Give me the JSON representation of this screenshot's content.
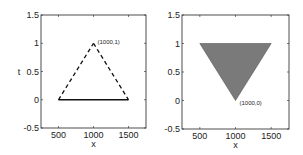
{
  "chart_data": [
    {
      "type": "line",
      "title": "",
      "xlabel": "x",
      "ylabel": "t",
      "xlim": [
        250,
        1750
      ],
      "ylim": [
        -0.5,
        1.5
      ],
      "xticks": [
        500,
        1000,
        1500
      ],
      "yticks": [
        -0.5,
        0,
        0.5,
        1,
        1.5
      ],
      "xtick_labels": [
        "500",
        "1000",
        "1500"
      ],
      "ytick_labels": [
        "-0.5",
        "0",
        "0.5",
        "1",
        "1.5"
      ],
      "grid": false,
      "series": [
        {
          "name": "base",
          "style": "solid",
          "x": [
            500,
            1500
          ],
          "y": [
            0,
            0
          ]
        },
        {
          "name": "left-edge",
          "style": "dashed",
          "x": [
            500,
            1000
          ],
          "y": [
            0,
            1
          ]
        },
        {
          "name": "right-edge",
          "style": "dashed",
          "x": [
            1000,
            1500
          ],
          "y": [
            1,
            0
          ]
        }
      ],
      "annotations": [
        {
          "text": "(1000,1)",
          "x": 1000,
          "y": 1
        }
      ]
    },
    {
      "type": "area",
      "title": "",
      "xlabel": "x",
      "ylabel": "",
      "xlim": [
        250,
        1750
      ],
      "ylim": [
        -0.5,
        1.5
      ],
      "xticks": [
        500,
        1000,
        1500
      ],
      "yticks": [
        -0.5,
        0,
        0.5,
        1,
        1.5
      ],
      "xtick_labels": [
        "500",
        "1000",
        "1500"
      ],
      "ytick_labels": [
        "-0.5",
        "0",
        "0.5",
        "1",
        "1.5"
      ],
      "grid": false,
      "series": [
        {
          "name": "filled-triangle",
          "style": "filled",
          "fill": "#7a7a7a",
          "x": [
            500,
            1500,
            1000
          ],
          "y": [
            1,
            1,
            0
          ]
        }
      ],
      "annotations": [
        {
          "text": "(1000,0)",
          "x": 1000,
          "y": 0
        }
      ]
    }
  ]
}
